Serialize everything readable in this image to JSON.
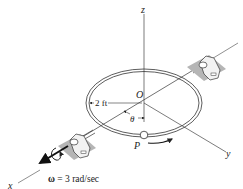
{
  "figure": {
    "axes": {
      "z_label": "z",
      "x_label": "x",
      "y_label": "y",
      "origin_label": "O"
    },
    "ring": {
      "radius_label": "2 ft",
      "angle_label": "θ",
      "point_label": "P"
    },
    "angular_velocity": {
      "symbol": "ω",
      "equals": " = 3 rad/sec"
    },
    "colors": {
      "line": "#333333",
      "support_shadow": "#b5b5b5",
      "support_body": "#f2f2f2"
    }
  }
}
